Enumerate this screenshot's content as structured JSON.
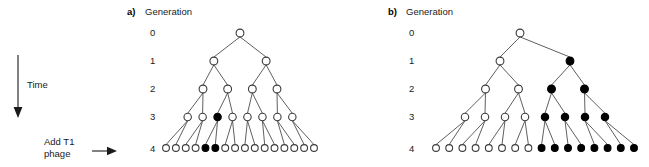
{
  "figure": {
    "width": 649,
    "height": 167,
    "background": "#ffffff",
    "node_open_fill": "#ffffff",
    "node_filled_fill": "#000000",
    "node_stroke": "#3a3a3a",
    "edge_color": "#4d4d4d"
  },
  "time_axis": {
    "label": "Time",
    "direction": "down",
    "x": 18,
    "y_start": 55,
    "y_end": 116
  },
  "treatment": {
    "label_line1": "Add T1",
    "label_line2": "phage",
    "arrow_direction": "right",
    "applies_to_generation": "4"
  },
  "generation_axis": {
    "header": "Generation",
    "ticks": [
      "0",
      "1",
      "2",
      "3",
      "4"
    ],
    "row_y": [
      33,
      61,
      89,
      117,
      148
    ]
  },
  "panels": [
    {
      "letter": "a)",
      "header": "Generation",
      "label_x": 127,
      "tick_x": 150,
      "center_x": 240,
      "row_span": [
        166,
        314
      ],
      "levels": [
        {
          "generation": "0",
          "count": 1,
          "filled_indices": []
        },
        {
          "generation": "1",
          "count": 2,
          "filled_indices": []
        },
        {
          "generation": "2",
          "count": 4,
          "filled_indices": []
        },
        {
          "generation": "3",
          "count": 8,
          "filled_indices": [
            2
          ]
        },
        {
          "generation": "4",
          "count": 16,
          "filled_indices": [
            4,
            5
          ]
        }
      ]
    },
    {
      "letter": "b)",
      "header": "Generation",
      "label_x": 388,
      "tick_x": 409,
      "center_x": 520,
      "row_span": [
        436,
        634
      ],
      "levels": [
        {
          "generation": "0",
          "count": 1,
          "filled_indices": []
        },
        {
          "generation": "1",
          "count": 2,
          "filled_indices": [
            1
          ]
        },
        {
          "generation": "2",
          "count": 4,
          "filled_indices": [
            2,
            3
          ]
        },
        {
          "generation": "3",
          "count": 8,
          "filled_indices": [
            4,
            5,
            6,
            7
          ]
        },
        {
          "generation": "4",
          "count": 16,
          "filled_indices": [
            8,
            9,
            10,
            11,
            12,
            13,
            14,
            15
          ]
        }
      ]
    }
  ]
}
